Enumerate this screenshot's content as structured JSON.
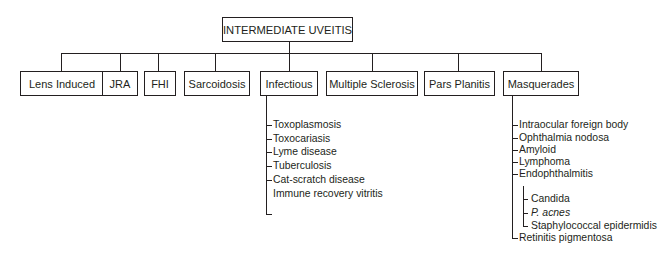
{
  "diagram": {
    "root": {
      "label": "INTERMEDIATE UVEITIS"
    },
    "categories": [
      {
        "id": "lens-induced",
        "label": "Lens Induced"
      },
      {
        "id": "jra",
        "label": "JRA"
      },
      {
        "id": "fhi",
        "label": "FHI"
      },
      {
        "id": "sarcoidosis",
        "label": "Sarcoidosis"
      },
      {
        "id": "infectious",
        "label": "Infectious",
        "children": [
          "Toxoplasmosis",
          "Toxocariasis",
          "Lyme disease",
          "Tuberculosis",
          "Cat-scratch disease",
          "Immune recovery vitritis"
        ]
      },
      {
        "id": "multiple-sclerosis",
        "label": "Multiple Sclerosis"
      },
      {
        "id": "pars-planitis",
        "label": "Pars Planitis"
      },
      {
        "id": "masquerades",
        "label": "Masquerades",
        "children": [
          "Intraocular foreign body",
          "Ophthalmia nodosa",
          "Amyloid",
          "Lymphoma",
          "Endophthalmitis"
        ],
        "endophthalmitis_children": [
          "Candida",
          "P. acnes",
          "Staphylococcal epidermidis"
        ],
        "last_child": "Retinitis pigmentosa"
      }
    ]
  },
  "colors": {
    "line": "#231f20",
    "background": "#ffffff"
  }
}
